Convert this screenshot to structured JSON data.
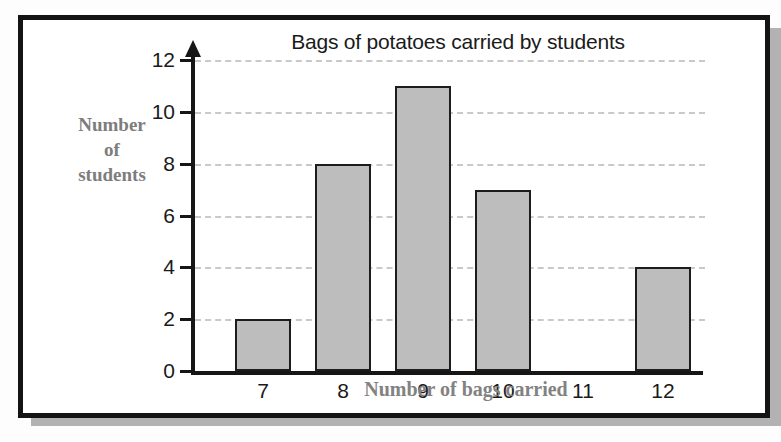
{
  "figure": {
    "frame_color": "#141414",
    "shadow_color": "#b2b2b2",
    "background": "#ffffff"
  },
  "chart_data": {
    "type": "bar",
    "title": "Bags of potatoes carried by students",
    "xlabel": "Number of bags carried",
    "ylabel_lines": [
      "Number",
      "of",
      "students"
    ],
    "ylabel": "Number of students",
    "categories": [
      "7",
      "8",
      "9",
      "10",
      "11",
      "12"
    ],
    "values": [
      2,
      8,
      11,
      7,
      0,
      4
    ],
    "ylim": [
      0,
      12
    ],
    "ytick_labels": [
      "0",
      "2",
      "4",
      "6",
      "8",
      "10",
      "12"
    ],
    "ytick_values": [
      0,
      2,
      4,
      6,
      8,
      10,
      12
    ],
    "grid": true,
    "grid_style": "dashed",
    "grid_color": "#c9c9c9",
    "legend": "none",
    "bar_fill": "#bdbdbd",
    "bar_edge": "#1c1c1c",
    "axis_color": "#161616",
    "title_color": "#1a1a1a",
    "axis_label_color": "#808080",
    "y_axis_arrow": true
  }
}
